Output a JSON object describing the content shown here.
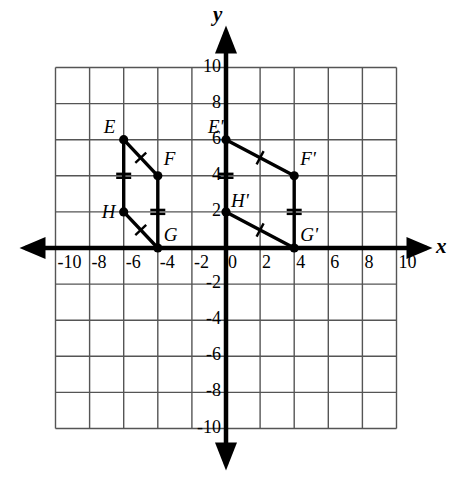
{
  "figure": {
    "kind": "coordinate-plane",
    "axis_labels": {
      "x": "x",
      "y": "y"
    },
    "grid": {
      "x_min": -10,
      "x_max": 10,
      "y_min": -10,
      "y_max": 10,
      "cell_step": 2,
      "grid_color": "#555555",
      "axis_color": "#000000"
    },
    "x_tick_labels": [
      "-10",
      "-8",
      "-6",
      "-4",
      "-2",
      "0",
      "2",
      "4",
      "6",
      "8",
      "10"
    ],
    "y_tick_labels": [
      "10",
      "8",
      "6",
      "4",
      "2",
      "-2",
      "-4",
      "-6",
      "-8",
      "-10"
    ],
    "shapes": [
      {
        "name": "quadrilateral-EFGH",
        "vertices": [
          {
            "label": "E",
            "x": -6,
            "y": 6,
            "label_dx": -20,
            "label_dy": -24
          },
          {
            "label": "F",
            "x": -4,
            "y": 4,
            "label_dx": 6,
            "label_dy": -28
          },
          {
            "label": "G",
            "x": -4,
            "y": 0,
            "label_dx": 6,
            "label_dy": -24
          },
          {
            "label": "H",
            "x": -6,
            "y": 2,
            "label_dx": -22,
            "label_dy": -11
          }
        ],
        "edges": [
          {
            "from": "E",
            "to": "F",
            "ticks": 1
          },
          {
            "from": "F",
            "to": "G",
            "ticks": 2
          },
          {
            "from": "G",
            "to": "H",
            "ticks": 1
          },
          {
            "from": "H",
            "to": "E",
            "ticks": 2
          }
        ]
      },
      {
        "name": "quadrilateral-EFGH-prime",
        "vertices": [
          {
            "label": "E'",
            "x": 0,
            "y": 6,
            "label_dx": -18,
            "label_dy": -24
          },
          {
            "label": "F'",
            "x": 4,
            "y": 4,
            "label_dx": 6,
            "label_dy": -28
          },
          {
            "label": "G'",
            "x": 4,
            "y": 0,
            "label_dx": 6,
            "label_dy": -24
          },
          {
            "label": "H'",
            "x": 0,
            "y": 2,
            "label_dx": 5,
            "label_dy": -22
          }
        ],
        "edges": [
          {
            "from": "E'",
            "to": "F'",
            "ticks": 1
          },
          {
            "from": "F'",
            "to": "G'",
            "ticks": 2
          },
          {
            "from": "G'",
            "to": "H'",
            "ticks": 1
          },
          {
            "from": "H'",
            "to": "E'",
            "ticks": 2
          }
        ]
      }
    ]
  },
  "chart_data": {
    "type": "scatter",
    "title": "",
    "xlabel": "x",
    "ylabel": "y",
    "xlim": [
      -10,
      10
    ],
    "ylim": [
      -10,
      10
    ],
    "grid": true,
    "legend": "none",
    "series": [
      {
        "name": "EFGH",
        "closed": true,
        "point_labels": [
          "E",
          "F",
          "G",
          "H"
        ],
        "x": [
          -6,
          -4,
          -4,
          -6
        ],
        "y": [
          6,
          4,
          0,
          2
        ]
      },
      {
        "name": "E'F'G'H'",
        "closed": true,
        "point_labels": [
          "E'",
          "F'",
          "G'",
          "H'"
        ],
        "x": [
          0,
          4,
          4,
          0
        ],
        "y": [
          6,
          4,
          0,
          2
        ]
      }
    ],
    "annotations": {
      "transformation": "translation",
      "vector": [
        6,
        0
      ],
      "tick_marks": {
        "single": [
          "EF",
          "GH",
          "E'F'",
          "G'H'"
        ],
        "double": [
          "FG",
          "HE",
          "F'G'",
          "H'E'"
        ]
      }
    }
  }
}
